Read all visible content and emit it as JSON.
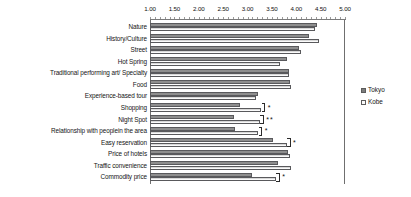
{
  "chart_data": {
    "type": "bar",
    "orientation": "horizontal",
    "title": "",
    "xlabel": "",
    "ylabel": "",
    "xlim": [
      1.0,
      5.0
    ],
    "grid": false,
    "legend_position": "right",
    "tick_labels": [
      "1.00",
      "1.50",
      "2.00",
      "2.50",
      "3.00",
      "3.50",
      "4.00",
      "4.50",
      "5.00"
    ],
    "ticks": [
      1.0,
      1.5,
      2.0,
      2.5,
      3.0,
      3.5,
      4.0,
      4.5,
      5.0
    ],
    "categories": [
      "Nature",
      "History/Culture",
      "Street",
      "Hot Spring",
      "Traditional  performing art/  Specialty",
      "Food",
      "Experience-based tour",
      "Shopping",
      "Night Spot",
      "Relationship with peoplein the area",
      "Easy reservation",
      "Price of hotels",
      "Traffic convenience",
      "Commodity price"
    ],
    "series": [
      {
        "name": "Tokyo",
        "values": [
          4.43,
          4.27,
          4.05,
          3.8,
          3.85,
          3.88,
          3.22,
          2.84,
          2.72,
          2.75,
          3.52,
          3.83,
          3.62,
          3.1
        ]
      },
      {
        "name": "Kobe",
        "values": [
          4.39,
          4.46,
          4.09,
          3.66,
          3.86,
          3.9,
          3.18,
          3.28,
          3.25,
          3.22,
          3.8,
          3.88,
          3.9,
          3.58
        ]
      }
    ],
    "annotations": [
      {
        "category": "Shopping",
        "stars": "*"
      },
      {
        "category": "Night Spot",
        "stars": "**"
      },
      {
        "category": "Relationship with peoplein the area",
        "stars": "*"
      },
      {
        "category": "Easy reservation",
        "stars": "*"
      },
      {
        "category": "Commodity price",
        "stars": "*"
      }
    ]
  },
  "legend": {
    "items": [
      {
        "label": "Tokyo",
        "swatch": "tokyo-swatch"
      },
      {
        "label": "Kobe",
        "swatch": "kobe-swatch"
      }
    ]
  }
}
